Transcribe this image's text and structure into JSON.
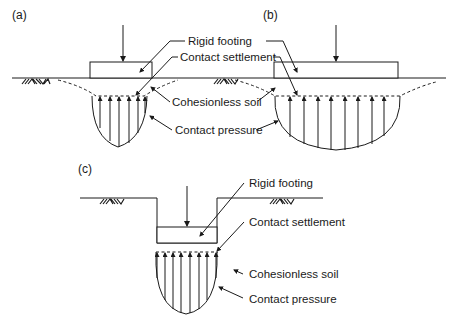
{
  "figure": {
    "panels": [
      {
        "id": "a",
        "label": "(a)",
        "description": "Rigid footing on ground surface, narrow pressure bulb"
      },
      {
        "id": "b",
        "label": "(b)",
        "description": "Rigid footing on ground surface, wide footing with flatter pressure distribution"
      },
      {
        "id": "c",
        "label": "(c)",
        "description": "Rigid footing embedded below ground surface"
      }
    ],
    "labels_top": {
      "rigid_footing": "Rigid footing",
      "contact_settlement": "Contact settlement",
      "cohesionless_soil": "Cohesionless soil",
      "contact_pressure": "Contact pressure"
    },
    "labels_c": {
      "rigid_footing": "Rigid footing",
      "contact_settlement": "Contact settlement",
      "cohesionless_soil": "Cohesionless soil",
      "contact_pressure": "Contact pressure"
    },
    "colors": {
      "ink": "#1a1a1a",
      "background": "#ffffff"
    }
  }
}
